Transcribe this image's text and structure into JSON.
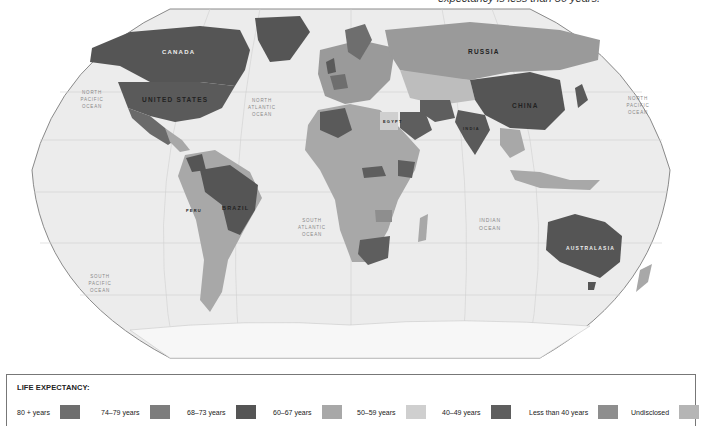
{
  "caption": "expectancy is less than 50 years.",
  "map": {
    "projection": "Robinson",
    "background_color": "#ededed",
    "country_labels": [
      {
        "key": "canada",
        "text": "CANADA"
      },
      {
        "key": "usa",
        "text": "UNITED STATES"
      },
      {
        "key": "russia",
        "text": "RUSSIA"
      },
      {
        "key": "china",
        "text": "CHINA"
      },
      {
        "key": "brazil",
        "text": "BRAZIL"
      },
      {
        "key": "australasia",
        "text": "AUSTRALASIA"
      },
      {
        "key": "india",
        "text": "INDIA"
      },
      {
        "key": "egypt",
        "text": "EGYPT"
      },
      {
        "key": "peru",
        "text": "PERU"
      }
    ],
    "ocean_labels": {
      "north_pacific_west": [
        "NORTH",
        "PACIFIC",
        "OCEAN"
      ],
      "north_atlantic": [
        "NORTH",
        "ATLANTIC",
        "OCEAN"
      ],
      "north_pacific_east": [
        "NORTH",
        "PACIFIC",
        "OCEAN"
      ],
      "south_atlantic": [
        "SOUTH",
        "ATLANTIC",
        "OCEAN"
      ],
      "indian": [
        "INDIAN",
        "OCEAN"
      ],
      "south_pacific": [
        "SOUTH",
        "PACIFIC",
        "OCEAN"
      ]
    }
  },
  "legend": {
    "title": "LIFE EXPECTANCY:",
    "items": [
      {
        "label": "80 + years",
        "color": "#6e6e6e"
      },
      {
        "label": "74–79 years",
        "color": "#7d7d7d"
      },
      {
        "label": "68–73 years",
        "color": "#555555"
      },
      {
        "label": "60–67 years",
        "color": "#a8a8a8"
      },
      {
        "label": "50–59 years",
        "color": "#cfcfcf"
      },
      {
        "label": "40–49 years",
        "color": "#5e5e5e"
      },
      {
        "label": "Less than 40 years",
        "color": "#8e8e8e"
      },
      {
        "label": "Undisclosed",
        "color": "#b5b5b5"
      }
    ]
  }
}
